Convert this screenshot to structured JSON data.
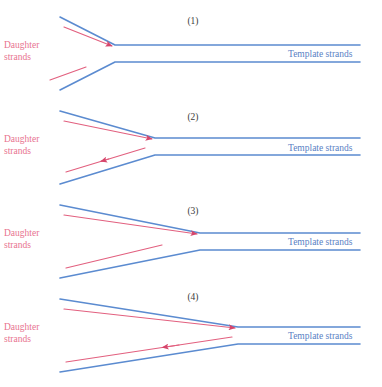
{
  "figure": {
    "background": "#ffffff",
    "colors": {
      "template_strand": "#5B8BD0",
      "daughter_strand": "#E2607F",
      "arrowhead": "#D6456B",
      "panel_number": "#3b3b3b",
      "daughter_label": "#e8738f",
      "template_label": "#5a7fc4"
    },
    "labels": {
      "daughter_line1": "Daughter",
      "daughter_line2": "strands",
      "template": "Template strands"
    },
    "panels": [
      {
        "number": "(1)",
        "number_x": 193,
        "number_y": 24,
        "fork_x": 115,
        "fork_upper_y": 45,
        "fork_lower_y": 62,
        "left_upper_y": 17,
        "left_lower_y": 90,
        "left_x": 60,
        "right_x": 360,
        "daughter_label_x": 4,
        "daughter_label_y": 48,
        "template_label_x": 288,
        "template_label_y": 57,
        "leading_arrow": {
          "from_x": 64,
          "from_y": 27,
          "to_x": 112,
          "to_y": 46,
          "direction": "right",
          "has_arrowhead": true
        },
        "lagging_arrow": {
          "from_x": 50,
          "from_y": 80,
          "to_x": 86,
          "to_y": 67,
          "direction": "none",
          "has_arrowhead": false
        }
      },
      {
        "number": "(2)",
        "number_x": 193,
        "number_y": 120,
        "fork_x": 155,
        "fork_upper_y": 138,
        "fork_lower_y": 155,
        "left_upper_y": 111,
        "left_lower_y": 184,
        "left_x": 60,
        "right_x": 360,
        "daughter_label_x": 4,
        "daughter_label_y": 142,
        "template_label_x": 288,
        "template_label_y": 151,
        "leading_arrow": {
          "from_x": 64,
          "from_y": 121,
          "to_x": 152,
          "to_y": 139,
          "direction": "right",
          "has_arrowhead": true
        },
        "lagging_arrow": {
          "from_x": 145,
          "from_y": 148,
          "to_x": 66,
          "to_y": 172,
          "direction": "left",
          "has_arrowhead": true,
          "arrow_at_t": 0.56
        }
      },
      {
        "number": "(3)",
        "number_x": 193,
        "number_y": 214,
        "fork_x": 200,
        "fork_upper_y": 233,
        "fork_lower_y": 250,
        "left_upper_y": 205,
        "left_lower_y": 278,
        "left_x": 60,
        "right_x": 360,
        "daughter_label_x": 4,
        "daughter_label_y": 236,
        "template_label_x": 288,
        "template_label_y": 245,
        "leading_arrow": {
          "from_x": 64,
          "from_y": 215,
          "to_x": 197,
          "to_y": 234,
          "direction": "right",
          "has_arrowhead": true
        },
        "lagging_arrow": {
          "from_x": 66,
          "from_y": 268,
          "to_x": 162,
          "to_y": 245,
          "direction": "none",
          "has_arrowhead": false
        }
      },
      {
        "number": "(4)",
        "number_x": 193,
        "number_y": 300,
        "fork_x": 238,
        "fork_upper_y": 327,
        "fork_lower_y": 344,
        "left_upper_y": 299,
        "left_lower_y": 372,
        "left_x": 60,
        "right_x": 360,
        "daughter_label_x": 4,
        "daughter_label_y": 330,
        "template_label_x": 288,
        "template_label_y": 339,
        "leading_arrow": {
          "from_x": 64,
          "from_y": 309,
          "to_x": 235,
          "to_y": 328,
          "direction": "right",
          "has_arrowhead": true
        },
        "lagging_arrow": {
          "from_x": 232,
          "from_y": 337,
          "to_x": 66,
          "to_y": 362,
          "direction": "left",
          "has_arrowhead": true,
          "arrow_at_t": 0.42
        }
      }
    ]
  }
}
